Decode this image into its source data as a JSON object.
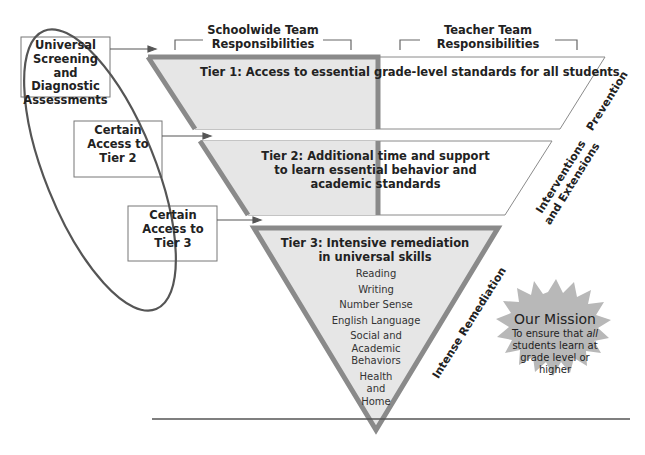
{
  "left_boxes": [
    {
      "label": "Universal Screening and Diagnostic Assessments"
    },
    {
      "label": "Certain Access to Tier 2"
    },
    {
      "label": "Certain Access to Tier 3"
    }
  ],
  "headers": {
    "schoolwide": "Schoolwide Team Responsibilities",
    "teacher": "Teacher Team Responsibilities"
  },
  "tiers": [
    {
      "title": "Tier 1: Access to essential grade-level standards for all students",
      "side_label": "Prevention"
    },
    {
      "title": "Tier 2: Additional time and support to learn essential behavior and academic standards",
      "side_label_line1": "Interventions",
      "side_label_line2": "and Extensions"
    },
    {
      "title_line1": "Tier 3: Intensive remediation",
      "title_line2": "in universal skills",
      "side_label": "Intense Remediation",
      "skills": [
        "Reading",
        "Writing",
        "Number Sense",
        "English Language",
        "Social and Academic Behaviors",
        "Health and Home"
      ]
    }
  ],
  "mission": {
    "title": "Our Mission",
    "body_pre": "To ensure that ",
    "body_em": "all",
    "body_post": " students learn at grade level or higher"
  },
  "colors": {
    "fill_gray": "#e6e6e6",
    "border_gray": "#8a8a8a",
    "starburst": "#b8b8b8",
    "line": "#555555"
  }
}
